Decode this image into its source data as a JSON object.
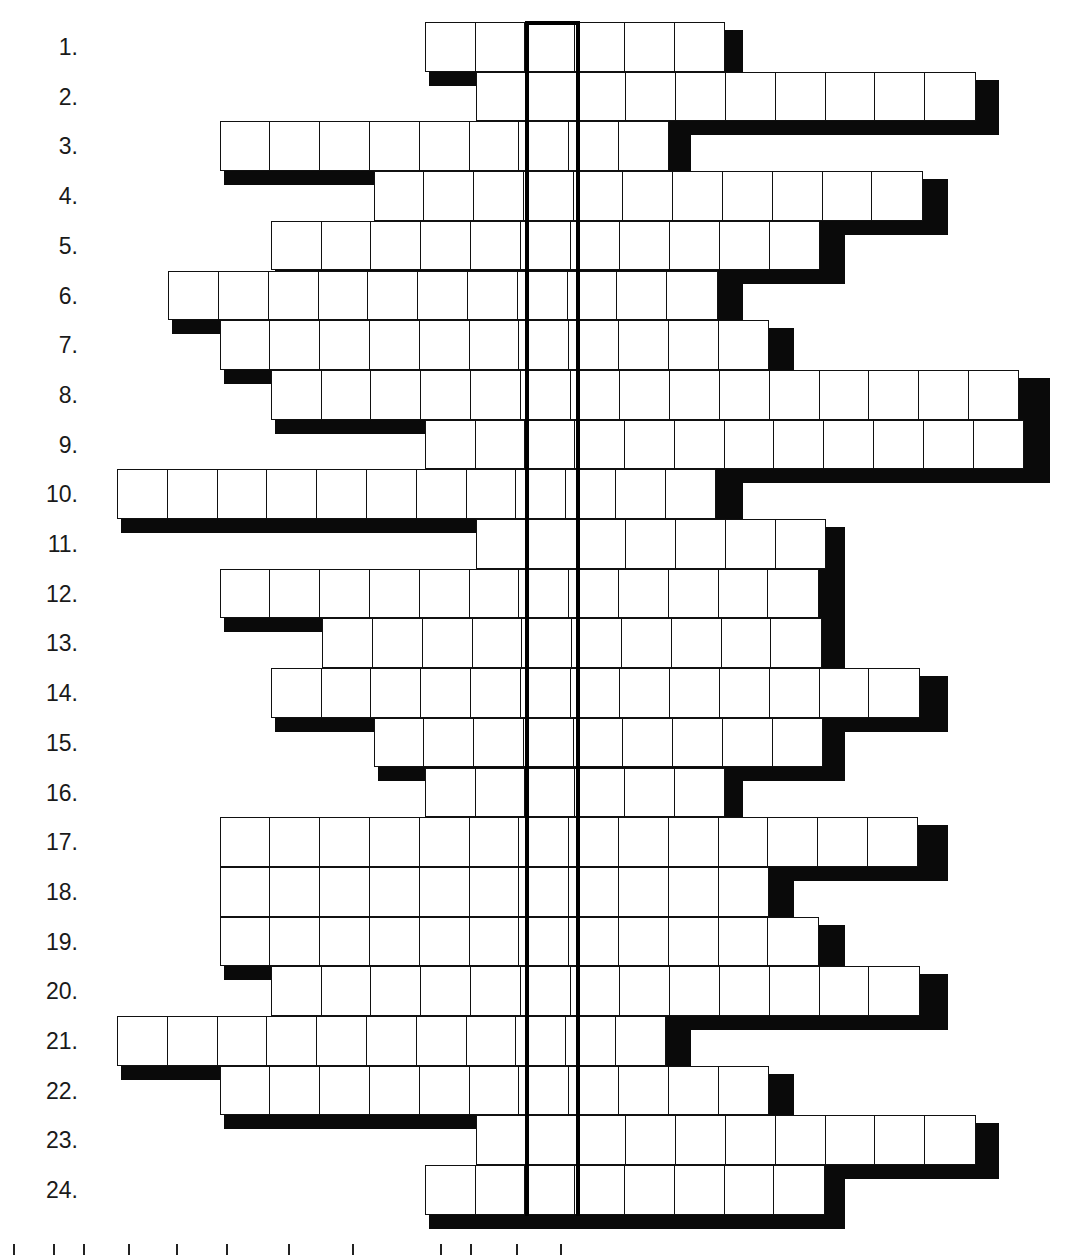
{
  "puzzle": {
    "type": "crossword-acrostic",
    "cell_width": 51.3,
    "cell_height": 49.7,
    "origin_x": 117,
    "origin_y": 22,
    "key_column": 8,
    "rows": [
      {
        "label": "1.",
        "start": 6,
        "end": 11
      },
      {
        "label": "2.",
        "start": 7,
        "end": 16
      },
      {
        "label": "3.",
        "start": 2,
        "end": 10
      },
      {
        "label": "4.",
        "start": 5,
        "end": 15
      },
      {
        "label": "5.",
        "start": 3,
        "end": 13
      },
      {
        "label": "6.",
        "start": 1,
        "end": 11
      },
      {
        "label": "7.",
        "start": 2,
        "end": 12
      },
      {
        "label": "8.",
        "start": 3,
        "end": 17
      },
      {
        "label": "9.",
        "start": 6,
        "end": 17
      },
      {
        "label": "10.",
        "start": 0,
        "end": 11
      },
      {
        "label": "11.",
        "start": 7,
        "end": 13
      },
      {
        "label": "12.",
        "start": 2,
        "end": 13
      },
      {
        "label": "13.",
        "start": 4,
        "end": 13
      },
      {
        "label": "14.",
        "start": 3,
        "end": 15
      },
      {
        "label": "15.",
        "start": 5,
        "end": 13
      },
      {
        "label": "16.",
        "start": 6,
        "end": 11
      },
      {
        "label": "17.",
        "start": 2,
        "end": 15
      },
      {
        "label": "18.",
        "start": 2,
        "end": 12
      },
      {
        "label": "19.",
        "start": 2,
        "end": 13
      },
      {
        "label": "20.",
        "start": 3,
        "end": 15
      },
      {
        "label": "21.",
        "start": 0,
        "end": 10
      },
      {
        "label": "22.",
        "start": 2,
        "end": 12
      },
      {
        "label": "23.",
        "start": 7,
        "end": 16
      },
      {
        "label": "24.",
        "start": 6,
        "end": 13
      }
    ]
  }
}
